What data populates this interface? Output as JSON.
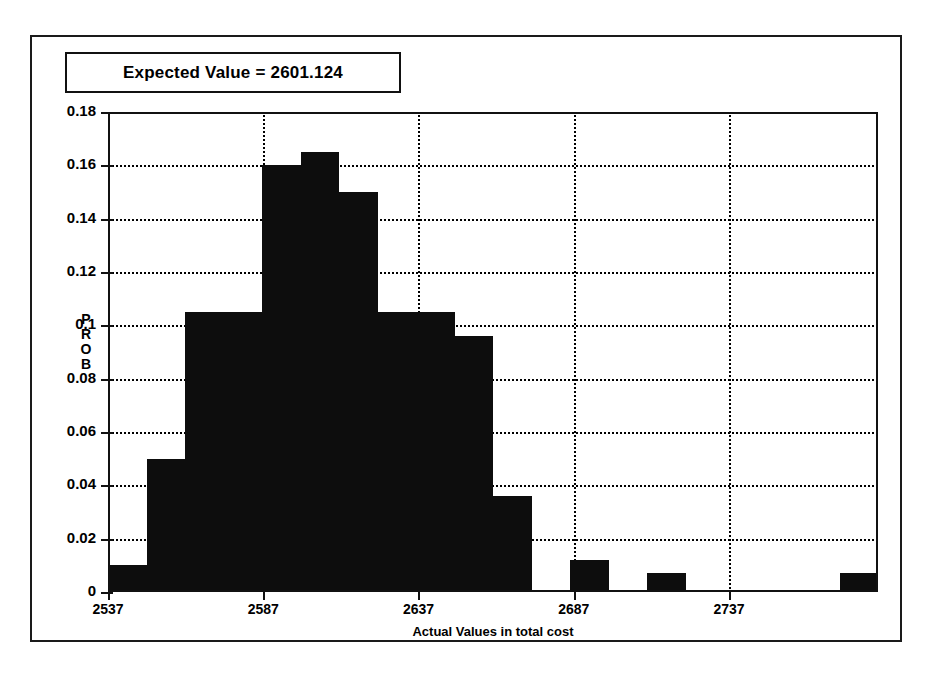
{
  "title": {
    "text": "Expected Value = 2601.124"
  },
  "axes": {
    "y_label_letters": [
      "P",
      "R",
      "O",
      "B"
    ],
    "y_label": "PROB",
    "x_label": "Actual Values in total cost",
    "y_ticks": [
      "0",
      "0.02",
      "0.04",
      "0.06",
      "0.08",
      "0.1",
      "0.12",
      "0.14",
      "0.16",
      "0.18"
    ],
    "x_ticks": [
      "2537",
      "2587",
      "2637",
      "2687",
      "2737"
    ]
  },
  "colors": {
    "bar": "#0d0d0d",
    "axis": "#111111",
    "grid": "#000000",
    "background": "#ffffff"
  },
  "chart_data": {
    "type": "bar",
    "title": "Expected Value = 2601.124",
    "xlabel": "Actual Values in total cost",
    "ylabel": "PROB",
    "xlim": [
      2537,
      2785
    ],
    "ylim": [
      0,
      0.18
    ],
    "grid": true,
    "legend": "none",
    "bin_width": 12.4,
    "x_tick_values": [
      2537,
      2587,
      2637,
      2687,
      2737
    ],
    "y_tick_values": [
      0,
      0.02,
      0.04,
      0.06,
      0.08,
      0.1,
      0.12,
      0.14,
      0.16,
      0.18
    ],
    "bins": [
      {
        "x0": 2537.0,
        "x1": 2549.4,
        "value": 0.01
      },
      {
        "x0": 2549.4,
        "x1": 2561.8,
        "value": 0.05
      },
      {
        "x0": 2561.8,
        "x1": 2574.2,
        "value": 0.105
      },
      {
        "x0": 2574.2,
        "x1": 2586.6,
        "value": 0.105
      },
      {
        "x0": 2586.6,
        "x1": 2599.0,
        "value": 0.16
      },
      {
        "x0": 2599.0,
        "x1": 2611.4,
        "value": 0.165
      },
      {
        "x0": 2611.4,
        "x1": 2623.8,
        "value": 0.15
      },
      {
        "x0": 2623.8,
        "x1": 2636.2,
        "value": 0.105
      },
      {
        "x0": 2636.2,
        "x1": 2648.6,
        "value": 0.105
      },
      {
        "x0": 2648.6,
        "x1": 2661.0,
        "value": 0.096
      },
      {
        "x0": 2661.0,
        "x1": 2673.4,
        "value": 0.036
      },
      {
        "x0": 2673.4,
        "x1": 2685.8,
        "value": 0.0
      },
      {
        "x0": 2685.8,
        "x1": 2698.2,
        "value": 0.012
      },
      {
        "x0": 2698.2,
        "x1": 2710.6,
        "value": 0.0
      },
      {
        "x0": 2710.6,
        "x1": 2723.0,
        "value": 0.007
      },
      {
        "x0": 2723.0,
        "x1": 2735.4,
        "value": 0.0
      },
      {
        "x0": 2735.4,
        "x1": 2747.8,
        "value": 0.0
      },
      {
        "x0": 2747.8,
        "x1": 2760.2,
        "value": 0.0
      },
      {
        "x0": 2760.2,
        "x1": 2772.6,
        "value": 0.0
      },
      {
        "x0": 2772.6,
        "x1": 2785.0,
        "value": 0.007
      }
    ]
  }
}
